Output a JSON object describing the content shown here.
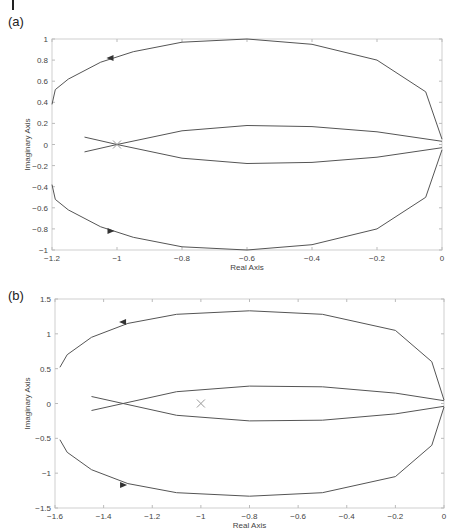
{
  "chart_data": [
    {
      "panel": "(a)",
      "type": "line",
      "title": "",
      "xlabel": "Real Axis",
      "ylabel": "Imaginary Axis",
      "xlim": [
        -1.2,
        0
      ],
      "ylim": [
        -1,
        1
      ],
      "xticks": [
        "-1.2",
        "-1",
        "-0.8",
        "-0.6",
        "-0.4",
        "-0.2",
        "0"
      ],
      "yticks": [
        "1",
        "0.8",
        "0.6",
        "0.4",
        "0.2",
        "0",
        "-0.2",
        "-0.4",
        "-0.6",
        "-0.8",
        "-1"
      ],
      "grid": false,
      "critical_point_marker": {
        "x": -1,
        "y": 0,
        "symbol": "x"
      },
      "series": [
        {
          "name": "nyquist-outer-upper",
          "x": [
            0,
            -0.05,
            -0.2,
            -0.4,
            -0.6,
            -0.8,
            -0.95,
            -1.05,
            -1.15,
            -1.19,
            -1.2
          ],
          "y": [
            0.05,
            0.5,
            0.8,
            0.95,
            1.0,
            0.97,
            0.88,
            0.78,
            0.62,
            0.52,
            0.38
          ]
        },
        {
          "name": "nyquist-outer-lower",
          "x": [
            0,
            -0.05,
            -0.2,
            -0.4,
            -0.6,
            -0.8,
            -0.95,
            -1.05,
            -1.15,
            -1.19,
            -1.2
          ],
          "y": [
            -0.05,
            -0.5,
            -0.8,
            -0.95,
            -1.0,
            -0.97,
            -0.88,
            -0.78,
            -0.62,
            -0.52,
            -0.38
          ]
        },
        {
          "name": "nyquist-inner-upper",
          "x": [
            0,
            -0.2,
            -0.4,
            -0.6,
            -0.8,
            -1.0,
            -1.1
          ],
          "y": [
            0.03,
            0.12,
            0.17,
            0.18,
            0.13,
            0.0,
            -0.07
          ]
        },
        {
          "name": "nyquist-inner-lower",
          "x": [
            0,
            -0.2,
            -0.4,
            -0.6,
            -0.8,
            -1.0,
            -1.1
          ],
          "y": [
            -0.03,
            -0.12,
            -0.17,
            -0.18,
            -0.13,
            0.0,
            0.07
          ]
        }
      ],
      "arrows": [
        {
          "x": -1.02,
          "y": 0.82,
          "direction": "left"
        },
        {
          "x": -1.02,
          "y": -0.82,
          "direction": "right"
        }
      ]
    },
    {
      "panel": "(b)",
      "type": "line",
      "title": "",
      "xlabel": "Real Axis",
      "ylabel": "Imaginary Axis",
      "xlim": [
        -1.6,
        0
      ],
      "ylim": [
        -1.5,
        1.5
      ],
      "xticks": [
        "-1.6",
        "-1.4",
        "-1.2",
        "-1",
        "-0.8",
        "-0.6",
        "-0.4",
        "-0.2",
        "0"
      ],
      "yticks": [
        "1.5",
        "1",
        "0.5",
        "0",
        "-0.5",
        "-1",
        "-1.5"
      ],
      "grid": false,
      "critical_point_marker": {
        "x": -1,
        "y": 0,
        "symbol": "x"
      },
      "series": [
        {
          "name": "nyquist-outer-upper",
          "x": [
            0,
            -0.05,
            -0.2,
            -0.5,
            -0.8,
            -1.1,
            -1.3,
            -1.45,
            -1.55,
            -1.58
          ],
          "y": [
            0.05,
            0.6,
            1.05,
            1.28,
            1.33,
            1.28,
            1.15,
            0.95,
            0.7,
            0.52
          ]
        },
        {
          "name": "nyquist-outer-lower",
          "x": [
            0,
            -0.05,
            -0.2,
            -0.5,
            -0.8,
            -1.1,
            -1.3,
            -1.45,
            -1.55,
            -1.58
          ],
          "y": [
            -0.05,
            -0.6,
            -1.05,
            -1.28,
            -1.33,
            -1.28,
            -1.15,
            -0.95,
            -0.7,
            -0.52
          ]
        },
        {
          "name": "nyquist-inner-upper",
          "x": [
            0,
            -0.2,
            -0.5,
            -0.8,
            -1.1,
            -1.32,
            -1.45
          ],
          "y": [
            0.04,
            0.15,
            0.24,
            0.25,
            0.17,
            0.0,
            -0.1
          ]
        },
        {
          "name": "nyquist-inner-lower",
          "x": [
            0,
            -0.2,
            -0.5,
            -0.8,
            -1.1,
            -1.32,
            -1.45
          ],
          "y": [
            -0.04,
            -0.15,
            -0.24,
            -0.25,
            -0.17,
            0.0,
            0.1
          ]
        }
      ],
      "arrows": [
        {
          "x": -1.32,
          "y": 1.17,
          "direction": "left"
        },
        {
          "x": -1.32,
          "y": -1.17,
          "direction": "right"
        }
      ]
    }
  ],
  "panels": {
    "a": {
      "label": "(a)",
      "xlabel": "Real Axis",
      "ylabel": "Imaginary Axis"
    },
    "b": {
      "label": "(b)",
      "xlabel": "Real Axis",
      "ylabel": "Imaginary Axis"
    }
  }
}
